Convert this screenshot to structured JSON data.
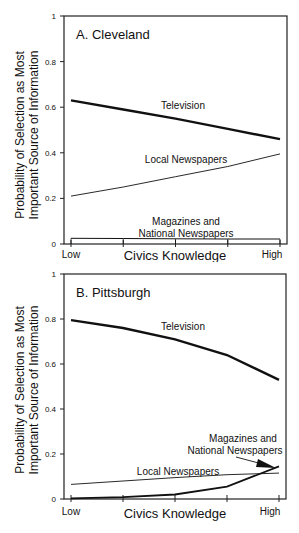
{
  "chart_data": [
    {
      "type": "line",
      "title": "A. Cleveland",
      "xlabel": "Civics Knowledge",
      "ylabel": "Probability of Selection as Most Important Source of Information",
      "ylabel_lines": [
        "Probability of Selection as Most",
        "Important Source of Information"
      ],
      "x_tick_labels": [
        "Low",
        "High"
      ],
      "x": [
        1,
        2,
        3,
        4,
        5
      ],
      "yticks": [
        "0",
        "0.2",
        "0.4",
        "0.6",
        "0.8",
        "1"
      ],
      "ylim": [
        0,
        1
      ],
      "grid": false,
      "series": [
        {
          "name": "Television",
          "values": [
            0.63,
            0.59,
            0.55,
            0.505,
            0.46
          ],
          "style": "thick"
        },
        {
          "name": "Local Newspapers",
          "values": [
            0.21,
            0.25,
            0.295,
            0.34,
            0.395
          ],
          "style": "thin"
        },
        {
          "name": "Magazines and National Newspapers",
          "values": [
            0.025,
            0.024,
            0.023,
            0.022,
            0.022
          ],
          "style": "thin"
        }
      ],
      "annotations": [
        {
          "text": "Television"
        },
        {
          "text": "Local Newspapers"
        },
        {
          "text_lines": [
            "Magazines and",
            "National Newspapers"
          ]
        }
      ]
    },
    {
      "type": "line",
      "title": "B. Pittsburgh",
      "xlabel": "Civics Knowledge",
      "ylabel": "Probability of Selection as Most Important Source of Information",
      "ylabel_lines": [
        "Probability of Selection as Most",
        "Important Source of Information"
      ],
      "x_tick_labels": [
        "Low",
        "High"
      ],
      "x": [
        1,
        2,
        3,
        4,
        5
      ],
      "yticks": [
        "0",
        "0.2",
        "0.4",
        "0.6",
        "0.8",
        "1"
      ],
      "ylim": [
        0,
        1
      ],
      "grid": false,
      "series": [
        {
          "name": "Television",
          "values": [
            0.795,
            0.76,
            0.71,
            0.64,
            0.53
          ],
          "style": "thick"
        },
        {
          "name": "Local Newspapers",
          "values": [
            0.065,
            0.08,
            0.095,
            0.108,
            0.115
          ],
          "style": "thin"
        },
        {
          "name": "Magazines and National Newspapers",
          "values": [
            0.003,
            0.008,
            0.02,
            0.055,
            0.145
          ],
          "style": "thick"
        }
      ],
      "annotations": [
        {
          "text": "Television"
        },
        {
          "text": "Local Newspapers"
        },
        {
          "text_lines": [
            "Magazines and",
            "National Newspapers"
          ],
          "arrow": true
        }
      ]
    }
  ]
}
